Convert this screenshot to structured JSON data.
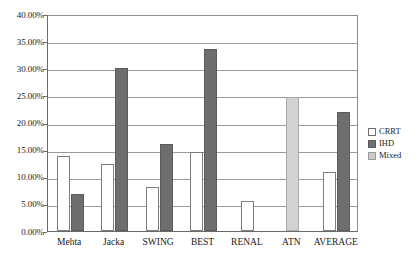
{
  "chart_data": {
    "type": "bar",
    "title": "",
    "subtitle": "",
    "xlabel": "",
    "ylabel": "",
    "categories": [
      "Mehta",
      "Jacka",
      "SWING",
      "BEST",
      "RENAL",
      "ATN",
      "AVERAGE"
    ],
    "series": [
      {
        "name": "CRRT",
        "color": "#ffffff",
        "values": [
          13.8,
          12.3,
          8.2,
          14.6,
          5.5,
          null,
          10.8
        ]
      },
      {
        "name": "IHD",
        "color": "#6e6e6e",
        "values": [
          6.8,
          30.1,
          16.1,
          33.6,
          null,
          null,
          22.0
        ]
      },
      {
        "name": "Mixed",
        "color": "#d2d2d2",
        "values": [
          null,
          null,
          null,
          null,
          null,
          24.7,
          null
        ]
      }
    ],
    "ylim": [
      0,
      40
    ],
    "ytick_values": [
      0,
      5,
      10,
      15,
      20,
      25,
      30,
      35,
      40
    ],
    "ytick_labels": [
      "0.00%",
      "5.00%",
      "10.00%",
      "15.00%",
      "20.00%",
      "25.00%",
      "30.00%",
      "35.00%",
      "40.00%"
    ],
    "value_suffix": "%",
    "grid": true,
    "grid_axis": "y",
    "legend_position": "right",
    "legend_entries": [
      "CRRT",
      "IHD",
      "Mixed"
    ]
  }
}
